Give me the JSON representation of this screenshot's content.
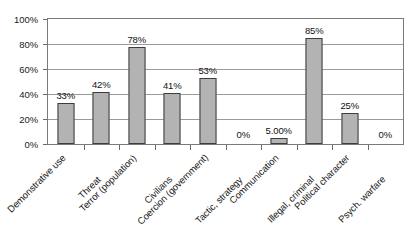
{
  "chart_data": {
    "type": "bar",
    "title": "",
    "subtitle": "",
    "xlabel": "",
    "ylabel": "",
    "ylim": [
      0,
      100
    ],
    "grid": true,
    "legend": null,
    "y_ticks": [
      "0%",
      "20%",
      "40%",
      "60%",
      "80%",
      "100%"
    ],
    "y_tick_values": [
      0,
      20,
      40,
      60,
      80,
      100
    ],
    "categories": [
      "Demonstrative use",
      "Threat",
      "Terror (population)",
      "Civilians",
      "Coercion (government)",
      "Tactic, strategy",
      "Communication",
      "Illegal, criminal",
      "Political character",
      "Psych. warfare"
    ],
    "values": [
      33,
      42,
      78,
      41,
      53,
      0,
      5,
      85,
      25,
      0
    ],
    "data_labels": [
      "33%",
      "42%",
      "78%",
      "41%",
      "53%",
      "0%",
      "5.00%",
      "85%",
      "25%",
      "0%"
    ],
    "bar_color": "#b3b3b3",
    "bar_border_color": "#3d3d3d",
    "grid_color": "#9a9a9a",
    "frame_color": "#7a7a7a",
    "background_color": "#ffffff",
    "text_color": "#1a1a1a"
  }
}
